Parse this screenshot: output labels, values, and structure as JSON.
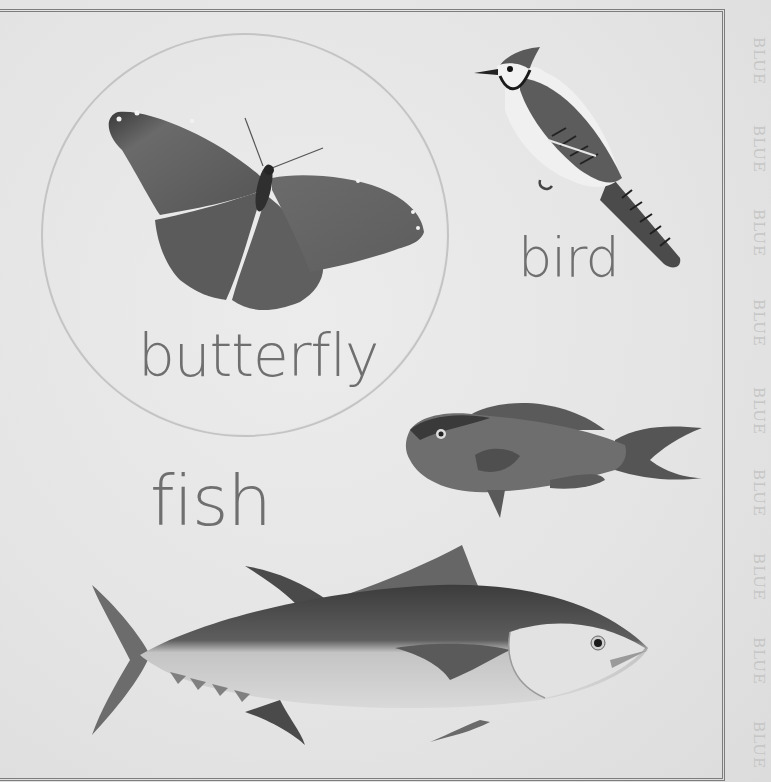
{
  "page": {
    "background": "#e4e4e4",
    "frame_color": "#7d7d7d",
    "margin_word": "BLUE",
    "margin_word_count": 9,
    "margin_word_color": "#c6c6c6"
  },
  "illustrations": [
    {
      "id": "butterfly",
      "label": "butterfly",
      "framed_in_circle": true
    },
    {
      "id": "bird",
      "label": "bird",
      "framed_in_circle": false
    },
    {
      "id": "parrotfish",
      "label": "",
      "framed_in_circle": false
    },
    {
      "id": "tuna",
      "label": "",
      "framed_in_circle": false
    }
  ],
  "labels": {
    "butterfly": "butterfly",
    "bird": "bird",
    "fish": "fish"
  },
  "margin": {
    "words": [
      "BLUE",
      "BLUE",
      "BLUE",
      "BLUE",
      "BLUE",
      "BLUE",
      "BLUE",
      "BLUE",
      "BLUE"
    ]
  }
}
